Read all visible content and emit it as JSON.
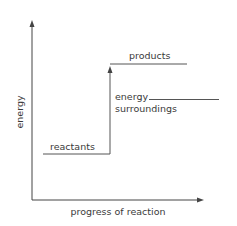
{
  "diagram": {
    "type": "energy-level-diagram",
    "y_axis_label": "energy",
    "x_axis_label": "progress of reaction",
    "levels": {
      "reactants": "reactants",
      "products": "products",
      "surroundings_line1": "energy",
      "surroundings_line2": "surroundings"
    },
    "colors": {
      "line": "#555555",
      "text": "#3a3a3a",
      "background": "#ffffff"
    }
  }
}
